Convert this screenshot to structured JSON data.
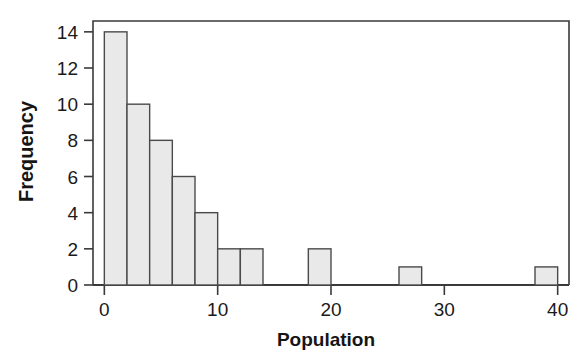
{
  "chart_data": {
    "type": "bar",
    "title": "",
    "subtitle": "",
    "xlabel": "Population",
    "ylabel": "Frequency",
    "xlim": [
      -1,
      41
    ],
    "ylim": [
      0,
      14.6
    ],
    "grid": false,
    "legend": null,
    "bin_width": 2,
    "xticks": [
      0,
      10,
      20,
      30,
      40
    ],
    "xtick_labels": [
      "0",
      "10",
      "20",
      "30",
      "40"
    ],
    "yticks": [
      0,
      2,
      4,
      6,
      8,
      10,
      12,
      14
    ],
    "ytick_labels": [
      "0",
      "2",
      "4",
      "6",
      "8",
      "10",
      "12",
      "14"
    ],
    "bin_edges": [
      0,
      2,
      4,
      6,
      8,
      10,
      12,
      14,
      16,
      18,
      20,
      22,
      24,
      26,
      28,
      30,
      32,
      34,
      36,
      38,
      40
    ],
    "values": [
      14,
      10,
      8,
      6,
      4,
      2,
      2,
      0,
      0,
      2,
      0,
      0,
      0,
      1,
      0,
      0,
      0,
      0,
      0,
      1
    ],
    "bars": [
      {
        "x0": 0,
        "x1": 2,
        "height": 14
      },
      {
        "x0": 2,
        "x1": 4,
        "height": 10
      },
      {
        "x0": 4,
        "x1": 6,
        "height": 8
      },
      {
        "x0": 6,
        "x1": 8,
        "height": 6
      },
      {
        "x0": 8,
        "x1": 10,
        "height": 4
      },
      {
        "x0": 10,
        "x1": 12,
        "height": 2
      },
      {
        "x0": 12,
        "x1": 14,
        "height": 2
      },
      {
        "x0": 18,
        "x1": 20,
        "height": 2
      },
      {
        "x0": 26,
        "x1": 28,
        "height": 1
      },
      {
        "x0": 38,
        "x1": 40,
        "height": 1
      }
    ],
    "colors": {
      "bar_fill": "#e9e9e9",
      "bar_edge": "#4a4a4a",
      "axis": "#3a3a3a",
      "text": "#151515",
      "background": "#ffffff"
    }
  }
}
